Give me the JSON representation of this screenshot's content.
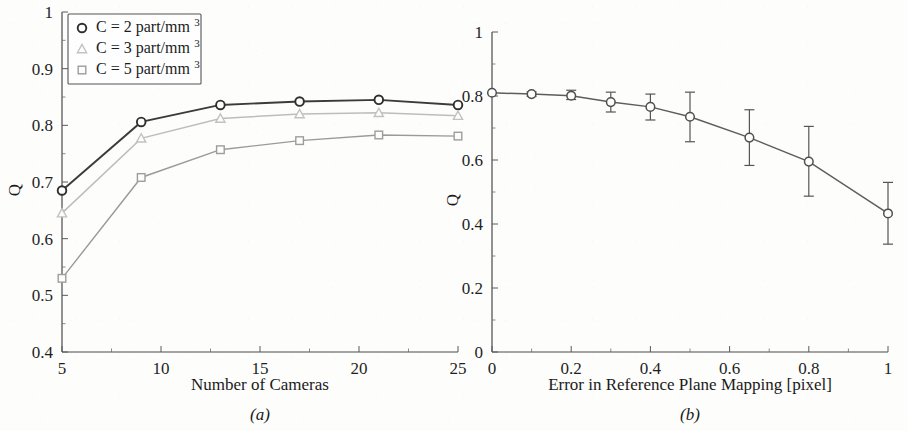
{
  "figure": {
    "background_color": "#fdfdfc",
    "width": 908,
    "height": 431
  },
  "panel_a": {
    "caption": "(a)",
    "xlabel": "Number of Cameras",
    "ylabel": "Q",
    "x_ticks": [
      "5",
      "10",
      "15",
      "20",
      "25"
    ],
    "y_ticks": [
      "0.4",
      "0.5",
      "0.6",
      "0.7",
      "0.8",
      "0.9",
      "1"
    ],
    "legend": {
      "items": [
        {
          "marker": "circle",
          "prefix": "C = 2 part/mm",
          "exponent": "3",
          "color": "#2e2e2e"
        },
        {
          "marker": "triangle",
          "prefix": "C = 3 part/mm",
          "exponent": "3",
          "color": "#c2c2c2"
        },
        {
          "marker": "square",
          "prefix": "C = 5 part/mm",
          "exponent": "3",
          "color": "#9d9d9d"
        }
      ]
    }
  },
  "panel_b": {
    "caption": "(b)",
    "xlabel": "Error in Reference Plane Mapping [pixel]",
    "ylabel": "Q",
    "x_ticks": [
      "0",
      "0.2",
      "0.4",
      "0.6",
      "0.8",
      "1"
    ],
    "y_ticks": [
      "0",
      "0.2",
      "0.4",
      "0.6",
      "0.8",
      "1"
    ]
  },
  "chart_data": [
    {
      "type": "line",
      "panel": "(a)",
      "title": "",
      "xlabel": "Number of Cameras",
      "ylabel": "Q",
      "xlim": [
        5,
        25
      ],
      "ylim": [
        0.4,
        1.0
      ],
      "x": [
        5,
        9,
        13,
        17,
        21,
        25
      ],
      "xticks": [
        5,
        10,
        15,
        20,
        25
      ],
      "yticks": [
        0.4,
        0.5,
        0.6,
        0.7,
        0.8,
        0.9,
        1.0
      ],
      "grid": false,
      "legend_position": "upper-left",
      "series": [
        {
          "name": "C = 2 part/mm^3",
          "marker": "circle",
          "color": "#2e2e2e",
          "values": [
            0.685,
            0.806,
            0.836,
            0.842,
            0.845,
            0.836
          ]
        },
        {
          "name": "C = 3 part/mm^3",
          "marker": "triangle",
          "color": "#c2c2c2",
          "values": [
            0.645,
            0.777,
            0.812,
            0.82,
            0.822,
            0.817
          ]
        },
        {
          "name": "C = 5 part/mm^3",
          "marker": "square",
          "color": "#9d9d9d",
          "values": [
            0.53,
            0.708,
            0.757,
            0.773,
            0.783,
            0.781
          ]
        }
      ]
    },
    {
      "type": "line",
      "panel": "(b)",
      "title": "",
      "xlabel": "Error in Reference Plane Mapping [pixel]",
      "ylabel": "Q",
      "xlim": [
        0,
        1.0
      ],
      "ylim": [
        0,
        1.0
      ],
      "xticks": [
        0,
        0.2,
        0.4,
        0.6,
        0.8,
        1.0
      ],
      "yticks": [
        0,
        0.2,
        0.4,
        0.6,
        0.8,
        1.0
      ],
      "grid": false,
      "legend_position": "none",
      "x": [
        0,
        0.1,
        0.2,
        0.3,
        0.4,
        0.5,
        0.65,
        0.8,
        1.0
      ],
      "series": [
        {
          "name": "Q vs mapping error",
          "marker": "circle",
          "color": "#4f4f4f",
          "values": [
            0.81,
            0.806,
            0.801,
            0.781,
            0.766,
            0.735,
            0.67,
            0.595,
            0.433
          ],
          "err_low": [
            0.81,
            0.799,
            0.789,
            0.75,
            0.725,
            0.657,
            0.583,
            0.487,
            0.337
          ],
          "err_high": [
            0.81,
            0.813,
            0.818,
            0.812,
            0.806,
            0.812,
            0.757,
            0.705,
            0.53
          ]
        }
      ]
    }
  ]
}
